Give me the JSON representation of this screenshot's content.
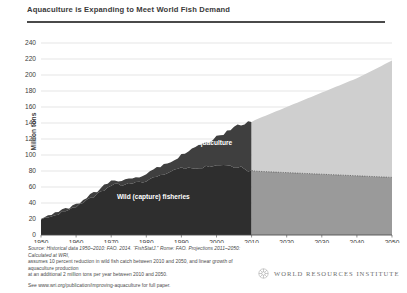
{
  "chart_data": {
    "type": "area",
    "title": "Aquaculture is Expanding to Meet World Fish Demand",
    "xlabel": "",
    "ylabel": "Million tons",
    "xlim": [
      1950,
      2050
    ],
    "ylim": [
      0,
      240
    ],
    "ytick_step": 20,
    "grid": true,
    "legend_position": "in-plot labels",
    "stacked": true,
    "xticks": [
      1950,
      1960,
      1970,
      1980,
      1990,
      2000,
      2010,
      2020,
      2030,
      2040,
      2050
    ],
    "yticks": [
      0,
      20,
      40,
      60,
      80,
      100,
      120,
      140,
      160,
      180,
      200,
      220,
      240
    ],
    "projection_start": 2010,
    "annotations": [
      {
        "text": "Aquaculture",
        "x": 1999,
        "y": 112
      },
      {
        "text": "Wild (capture) fisheries",
        "x": 1982,
        "y": 45
      }
    ],
    "series": [
      {
        "name": "Wild (capture) fisheries",
        "color_historical": "#2e2e2e",
        "color_projection": "#9a9a9a",
        "x": [
          1950,
          1955,
          1960,
          1965,
          1970,
          1975,
          1980,
          1985,
          1990,
          1995,
          2000,
          2005,
          2010,
          2020,
          2030,
          2040,
          2050
        ],
        "values": [
          19,
          27,
          35,
          48,
          62,
          63,
          68,
          77,
          83,
          85,
          86,
          86,
          80,
          78,
          76,
          74,
          72
        ]
      },
      {
        "name": "Aquaculture",
        "color_historical": "#3f3f3f",
        "color_projection": "#cfcfcf",
        "x": [
          1950,
          1955,
          1960,
          1965,
          1970,
          1975,
          1980,
          1985,
          1990,
          1995,
          2000,
          2005,
          2010,
          2020,
          2030,
          2040,
          2050
        ],
        "values": [
          1,
          2,
          3,
          4,
          5,
          7,
          8,
          11,
          17,
          26,
          36,
          49,
          62,
          82,
          102,
          122,
          146
        ]
      }
    ],
    "totals": {
      "x": [
        1950,
        1960,
        1970,
        1980,
        1990,
        2000,
        2010,
        2020,
        2030,
        2040,
        2050
      ],
      "values": [
        20,
        38,
        67,
        76,
        100,
        122,
        142,
        160,
        178,
        196,
        218
      ]
    }
  },
  "notes": {
    "line1": "Source: Historical data 1950–2010: FAO. 2014. “FishStatJ.” Rome: FAO. Projections 2011–2050: Calculated at WRI,",
    "line2": "assumes 10 percent reduction in wild fish catch between 2010 and 2050, and linear growth of aquaculture production",
    "line3": "at an additional 2 million tons per year between 2010 and 2050.",
    "line4": "See www.wri.org/publication/improving-aquaculture for full paper."
  },
  "logo": {
    "name": "WORLD RESOURCES INSTITUTE"
  }
}
